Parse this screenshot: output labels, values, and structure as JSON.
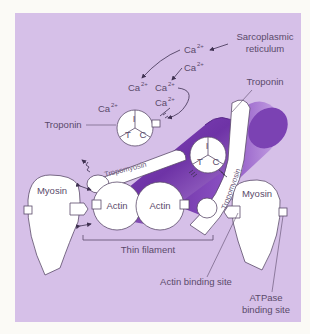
{
  "diagram": {
    "colors": {
      "page_background": "#fbfaf6",
      "panel_background": "#d6c0e8",
      "filament_purple": "#7a3fb0",
      "filament_highlight": "#a777d0",
      "outline": "#5a4a6a",
      "white": "#ffffff"
    },
    "labels": {
      "sarcoplasmic_reticulum_line1": "Sarcoplasmic",
      "sarcoplasmic_reticulum_line2": "reticulum",
      "troponin_right": "Troponin",
      "troponin_left": "Troponin",
      "tropomyosin_left": "Tropomyosin",
      "tropomyosin_right": "Tropomyosin",
      "myosin_left": "Myosin",
      "myosin_right": "Myosin",
      "actin_1": "Actin",
      "actin_2": "Actin",
      "thin_filament": "Thin filament",
      "actin_binding_site": "Actin binding site",
      "atpase_binding_site_line1": "ATPase",
      "atpase_binding_site_line2": "binding site"
    },
    "calcium": {
      "base": "Ca",
      "superscript": "2+",
      "count": 6
    },
    "troponin_subunits": {
      "top": "I",
      "left": "T",
      "right": "C"
    }
  }
}
